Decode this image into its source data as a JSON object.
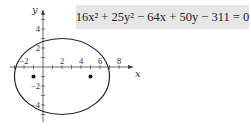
{
  "equation": "16x² + 25y² − 64x + 50y − 311 = 0",
  "chart_data": {
    "type": "line",
    "title": "",
    "annotation": "16x² + 25y² − 64x + 50y − 311 = 0",
    "xlabel": "x",
    "ylabel": "y",
    "xlim": [
      -3,
      9
    ],
    "ylim": [
      -6,
      6
    ],
    "x_ticks": [
      -2,
      2,
      4,
      6,
      8
    ],
    "y_ticks": [
      4,
      2,
      -2,
      -4
    ],
    "grid": false,
    "series": [
      {
        "name": "ellipse",
        "shape": "ellipse",
        "center": [
          2,
          -1
        ],
        "semi_major_x": 5,
        "semi_minor_y": 4
      },
      {
        "name": "foci",
        "points": [
          [
            -1,
            -1
          ],
          [
            5,
            -1
          ]
        ]
      }
    ]
  }
}
